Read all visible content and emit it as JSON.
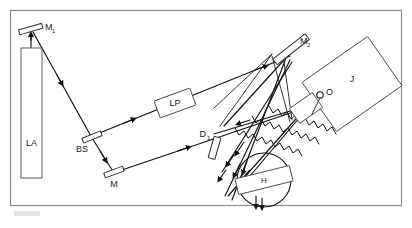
{
  "figure": {
    "frame": {
      "color": "#8a8a8a"
    },
    "ink_color": "#111111"
  },
  "components": [
    {
      "id": "M1",
      "label": "M",
      "sub": "1",
      "name": "mirror-m1",
      "role": "Steering mirror above laser"
    },
    {
      "id": "LA",
      "label": "LA",
      "sub": "",
      "name": "laser-la",
      "role": "Laser source body"
    },
    {
      "id": "BS",
      "label": "BS",
      "sub": "",
      "name": "beamsplitter-bs",
      "role": "Beam splitter"
    },
    {
      "id": "M",
      "label": "M",
      "sub": "",
      "name": "mirror-m",
      "role": "Fold mirror"
    },
    {
      "id": "LP",
      "label": "LP",
      "sub": "",
      "name": "element-lp",
      "role": "Lens / polarizer element"
    },
    {
      "id": "D1",
      "label": "D",
      "sub": "1",
      "name": "element-d1",
      "role": "Diffuser / detector element"
    },
    {
      "id": "M2",
      "label": "M",
      "sub": "2",
      "name": "mirror-m2",
      "role": "Steering mirror upper right"
    },
    {
      "id": "O",
      "label": "O",
      "sub": "",
      "name": "objective-o",
      "role": "Objective / output element"
    },
    {
      "id": "J",
      "label": "J",
      "sub": "",
      "name": "plate-j",
      "role": "Recording plate / holder"
    },
    {
      "id": "H",
      "label": "H",
      "sub": "",
      "name": "holder-h",
      "role": "Hologram in circular mount"
    }
  ],
  "labels": {
    "m1": "M",
    "m1_sub": "1",
    "la": "LA",
    "bs": "BS",
    "m": "M",
    "lp": "LP",
    "d1": "D",
    "d1_sub": "1",
    "m2": "M",
    "m2_sub": "2",
    "o": "O",
    "j": "J",
    "h": "H"
  }
}
